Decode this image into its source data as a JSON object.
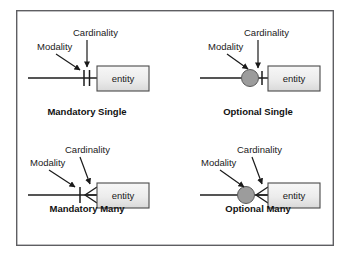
{
  "figure": {
    "frame": {
      "x": 16,
      "y": 10,
      "width": 318,
      "height": 236
    },
    "colors": {
      "frame_border": "#5e5e62",
      "line": "#1c1c1c",
      "entity_fill_top": "#f5f5f5",
      "entity_fill_bottom": "#dcdcdc",
      "entity_border": "#4a4a4a",
      "modality_circle_fill": "#9c9c9c",
      "text": "#1a1a1a",
      "background": "#ffffff"
    },
    "annotation_labels": {
      "cardinality": "Cardinality",
      "modality": "Modality"
    },
    "entity_label": "entity"
  },
  "panels": [
    {
      "id": "mandatory-single",
      "caption": "Mandatory Single",
      "caption_pos": {
        "x": 87,
        "y": 115
      },
      "entity": {
        "x": 97,
        "y": 66,
        "width": 52,
        "height": 25,
        "label": "entity"
      },
      "line": {
        "x1": 28,
        "y1": 78,
        "x2": 97,
        "y2": 78
      },
      "cardinality_label": {
        "text": "Cardinality",
        "x": 73,
        "y": 36
      },
      "modality_label": {
        "text": "Modality",
        "x": 37,
        "y": 50
      },
      "cardinality_arrow": {
        "x1": 87,
        "y1": 41,
        "x2": 87,
        "y2": 69
      },
      "modality_arrow": {
        "x1": 56,
        "y1": 54,
        "x2": 81,
        "y2": 71
      },
      "cardinality_symbol": "single-bar",
      "modality_symbol": "mandatory-bar",
      "cardinality_marks": [
        {
          "x": 89,
          "y1": 70,
          "y2": 86
        }
      ],
      "modality_marks": [
        {
          "x": 84,
          "y1": 70,
          "y2": 86
        }
      ]
    },
    {
      "id": "optional-single",
      "caption": "Optional Single",
      "caption_pos": {
        "x": 258,
        "y": 115
      },
      "entity": {
        "x": 268,
        "y": 66,
        "width": 52,
        "height": 25,
        "label": "entity"
      },
      "line": {
        "x1": 200,
        "y1": 78,
        "x2": 268,
        "y2": 78
      },
      "cardinality_label": {
        "text": "Cardinality",
        "x": 244,
        "y": 36
      },
      "modality_label": {
        "text": "Modality",
        "x": 208,
        "y": 50
      },
      "cardinality_arrow": {
        "x1": 258,
        "y1": 41,
        "x2": 258,
        "y2": 69
      },
      "modality_arrow": {
        "x1": 227,
        "y1": 54,
        "x2": 250,
        "y2": 70
      },
      "cardinality_symbol": "single-bar",
      "modality_symbol": "optional-circle",
      "cardinality_marks": [
        {
          "x": 261,
          "y1": 71,
          "y2": 85
        }
      ],
      "modality_circle": {
        "cx": 250,
        "cy": 78,
        "r": 8.5
      }
    },
    {
      "id": "mandatory-many",
      "caption": "Mandatory Many",
      "caption_pos": {
        "x": 87,
        "y": 212
      },
      "entity": {
        "x": 97,
        "y": 183,
        "width": 52,
        "height": 25,
        "label": "entity"
      },
      "line": {
        "x1": 28,
        "y1": 195,
        "x2": 97,
        "y2": 195
      },
      "cardinality_label": {
        "text": "Cardinality",
        "x": 65,
        "y": 153
      },
      "modality_label": {
        "text": "Modality",
        "x": 30,
        "y": 166
      },
      "cardinality_arrow": {
        "x1": 80,
        "y1": 158,
        "x2": 91,
        "y2": 186
      },
      "modality_arrow": {
        "x1": 49,
        "y1": 170,
        "x2": 76,
        "y2": 188
      },
      "cardinality_symbol": "crows-foot",
      "modality_symbol": "mandatory-bar",
      "modality_marks": [
        {
          "x": 80,
          "y1": 187,
          "y2": 203
        }
      ],
      "crows_foot": {
        "apex_x": 82,
        "apex_y": 195,
        "base_x": 97,
        "spread": 8
      }
    },
    {
      "id": "optional-many",
      "caption": "Optional Many",
      "caption_pos": {
        "x": 258,
        "y": 212
      },
      "entity": {
        "x": 268,
        "y": 183,
        "width": 52,
        "height": 25,
        "label": "entity"
      },
      "line": {
        "x1": 200,
        "y1": 195,
        "x2": 268,
        "y2": 195
      },
      "cardinality_label": {
        "text": "Cardinality",
        "x": 237,
        "y": 153
      },
      "modality_label": {
        "text": "Modality",
        "x": 201,
        "y": 166
      },
      "cardinality_arrow": {
        "x1": 252,
        "y1": 158,
        "x2": 263,
        "y2": 186
      },
      "modality_arrow": {
        "x1": 220,
        "y1": 170,
        "x2": 245,
        "y2": 188
      },
      "cardinality_symbol": "crows-foot",
      "modality_symbol": "optional-circle",
      "modality_circle": {
        "cx": 246,
        "cy": 195,
        "r": 8.5
      },
      "crows_foot": {
        "apex_x": 255,
        "apex_y": 195,
        "base_x": 268,
        "spread": 8
      }
    }
  ]
}
